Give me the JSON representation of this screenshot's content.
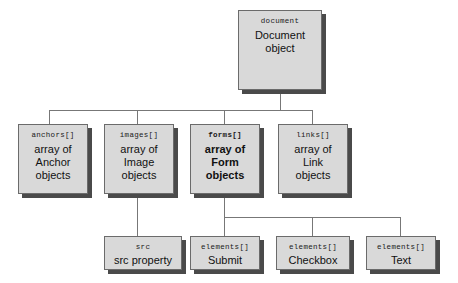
{
  "diagram": {
    "type": "tree",
    "background_color": "#ffffff",
    "node_fill_color": "#d9d9d9",
    "node_border_color": "#6b6b6b",
    "shadow_color": "#4a4a4a",
    "connector_color": "#777777",
    "nodes": {
      "document": {
        "code": "document",
        "desc": "Document\nobject",
        "bold": false
      },
      "anchors": {
        "code": "anchors[]",
        "desc": "array of\nAnchor\nobjects",
        "bold": false
      },
      "images": {
        "code": "images[]",
        "desc": "array of\nImage\nobjects",
        "bold": false
      },
      "forms": {
        "code": "forms[]",
        "desc": "array of\nForm\nobjects",
        "bold": true
      },
      "links": {
        "code": "links[]",
        "desc": "array of\nLink\nobjects",
        "bold": false
      },
      "src": {
        "code": "src",
        "desc": "src property",
        "bold": false
      },
      "submit": {
        "code": "elements[]",
        "desc": "Submit",
        "bold": false
      },
      "checkbox": {
        "code": "elements[]",
        "desc": "Checkbox",
        "bold": false
      },
      "text": {
        "code": "elements[]",
        "desc": "Text",
        "bold": false
      }
    },
    "edges": [
      {
        "from": "document",
        "to": "anchors"
      },
      {
        "from": "document",
        "to": "images"
      },
      {
        "from": "document",
        "to": "forms"
      },
      {
        "from": "document",
        "to": "links"
      },
      {
        "from": "images",
        "to": "src"
      },
      {
        "from": "forms",
        "to": "submit"
      },
      {
        "from": "forms",
        "to": "checkbox"
      },
      {
        "from": "forms",
        "to": "text"
      }
    ]
  }
}
